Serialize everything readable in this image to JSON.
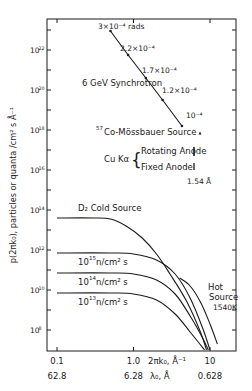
{
  "chart_data": {
    "type": "line",
    "title": "",
    "xscale": "log",
    "yscale": "log",
    "xlabel": "2πk₀, Å⁻¹",
    "xlabel_secondary": "λ₀, Å",
    "ylabel": "p(2πk₀), particles or quanta / cm² s Å⁻¹",
    "xlim": [
      0.08,
      20
    ],
    "ylim_log10": [
      7,
      23.5
    ],
    "x_ticks": [
      {
        "value": 0.1,
        "label": "0.1",
        "secondary": "62.8"
      },
      {
        "value": 1.0,
        "label": "1.0",
        "secondary": "6.28"
      },
      {
        "value": 10,
        "label": "10",
        "secondary": "0.628"
      }
    ],
    "y_ticks_log10": [
      {
        "value": 22,
        "label": "10^22"
      },
      {
        "value": 20,
        "label": "10^20"
      },
      {
        "value": 18,
        "label": "10^18"
      },
      {
        "value": 16,
        "label": "10^16"
      },
      {
        "value": 14,
        "label": "10^14"
      },
      {
        "value": 12,
        "label": "10^12"
      },
      {
        "value": 10,
        "label": "10^10"
      },
      {
        "value": 8,
        "label": "10^8"
      }
    ],
    "series": [
      {
        "name": "6 GeV Synchrotron",
        "style": "line-with-markers",
        "points": [
          {
            "x": 0.5,
            "log10y": 22.95,
            "annotation": "3×10⁻⁴ rads"
          },
          {
            "x": 0.85,
            "log10y": 21.75,
            "annotation": "2.2×10⁻⁴"
          },
          {
            "x": 1.45,
            "log10y": 20.6,
            "annotation": "1.7×10⁻⁴"
          },
          {
            "x": 2.4,
            "log10y": 19.5,
            "annotation": "1.2×10⁻⁴"
          },
          {
            "x": 4.3,
            "log10y": 18.2,
            "annotation": "10⁻⁴"
          }
        ]
      },
      {
        "name": "57Co-Mössbauer Source",
        "style": "point",
        "points": [
          {
            "x": 5.8,
            "log10y": 17.85
          }
        ]
      },
      {
        "name": "Cu Kα Rotating Anode",
        "style": "vertical-bar",
        "points": [
          {
            "x": 4.08,
            "log10y_range": [
              16.75,
              17.2
            ]
          }
        ]
      },
      {
        "name": "Cu Kα Fixed Anode",
        "style": "vertical-bar",
        "points": [
          {
            "x": 4.08,
            "log10y_range": [
              16.05,
              16.4
            ]
          }
        ],
        "annotation": "1.54 Å"
      },
      {
        "name": "D2 Cold Source",
        "style": "curve",
        "points": [
          {
            "x": 0.1,
            "log10y": 13.6
          },
          {
            "x": 0.3,
            "log10y": 13.6
          },
          {
            "x": 0.5,
            "log10y": 13.55
          },
          {
            "x": 0.8,
            "log10y": 13.2
          },
          {
            "x": 1.3,
            "log10y": 12.6
          },
          {
            "x": 2.0,
            "log10y": 11.8
          },
          {
            "x": 3.0,
            "log10y": 10.8
          },
          {
            "x": 5.0,
            "log10y": 9.4
          },
          {
            "x": 7.5,
            "log10y": 7.9
          },
          {
            "x": 9.0,
            "log10y": 7.0
          }
        ]
      },
      {
        "name": "10^15 n/cm² s",
        "style": "curve",
        "points": [
          {
            "x": 0.1,
            "log10y": 11.85
          },
          {
            "x": 0.5,
            "log10y": 11.85
          },
          {
            "x": 1.0,
            "log10y": 11.8
          },
          {
            "x": 2.0,
            "log10y": 11.5
          },
          {
            "x": 3.5,
            "log10y": 10.8
          },
          {
            "x": 5.5,
            "log10y": 9.6
          },
          {
            "x": 8.0,
            "log10y": 8.1
          },
          {
            "x": 10.0,
            "log10y": 7.0
          }
        ]
      },
      {
        "name": "10^14 n/cm² s",
        "style": "curve",
        "points": [
          {
            "x": 0.1,
            "log10y": 10.85
          },
          {
            "x": 0.5,
            "log10y": 10.85
          },
          {
            "x": 1.0,
            "log10y": 10.8
          },
          {
            "x": 2.0,
            "log10y": 10.5
          },
          {
            "x": 3.5,
            "log10y": 9.8
          },
          {
            "x": 5.5,
            "log10y": 8.7
          },
          {
            "x": 8.0,
            "log10y": 7.6
          },
          {
            "x": 9.5,
            "log10y": 7.0
          }
        ]
      },
      {
        "name": "10^13 n/cm² s",
        "style": "curve",
        "points": [
          {
            "x": 0.1,
            "log10y": 9.85
          },
          {
            "x": 0.5,
            "log10y": 9.85
          },
          {
            "x": 1.0,
            "log10y": 9.8
          },
          {
            "x": 2.0,
            "log10y": 9.5
          },
          {
            "x": 3.5,
            "log10y": 8.8
          },
          {
            "x": 5.5,
            "log10y": 7.9
          },
          {
            "x": 8.5,
            "log10y": 7.0
          }
        ]
      },
      {
        "name": "Hot Source 1540K",
        "style": "curve",
        "points": [
          {
            "x": 4.0,
            "log10y": 10.6
          },
          {
            "x": 5.5,
            "log10y": 10.2
          },
          {
            "x": 7.5,
            "log10y": 9.4
          },
          {
            "x": 10.0,
            "log10y": 8.3
          },
          {
            "x": 12.5,
            "log10y": 7.3
          }
        ]
      }
    ],
    "annotations": [
      {
        "text": "6 GeV Synchrotron"
      },
      {
        "text": "57Co-Mössbauer Source"
      },
      {
        "text": "Cu Kα { Rotating Anode / Fixed Anode"
      },
      {
        "text": "1.54 Å"
      },
      {
        "text": "D2 Cold Source"
      },
      {
        "text": "Hot Source 1540K"
      }
    ],
    "grid": false,
    "legend": "none (inline labels)"
  },
  "labels": {
    "ylabel_text": "p(2πk₀), particles or quanta /cm² s Å⁻¹",
    "xlabel_text": "2πk₀, Å⁻¹",
    "xlabel2_text": "λ₀, Å",
    "synchrotron": "6 GeV Synchrotron",
    "mossbauer": "Co-Mössbauer Source",
    "mossbauer_sup": "57",
    "cu_ka": "Cu Kα",
    "rotating": "Rotating Anode",
    "fixed": "Fixed Anode",
    "cu_wavelength": "1.54 Å",
    "d2": "D₂ Cold Source",
    "hot1": "Hot",
    "hot2": "Source",
    "hot3": "1540K",
    "flux15": "n/cm² s",
    "flux_exp15": "15",
    "flux_exp14": "14",
    "flux_exp13": "13",
    "ten": "10",
    "sync_pt1": "3×10⁻⁴ rads",
    "sync_pt2": "2.2×10⁻⁴",
    "sync_pt3": "1.7×10⁻⁴",
    "sync_pt4": "1.2×10⁻⁴",
    "sync_pt5": "10⁻⁴"
  },
  "colors": {
    "ink": "#1a1a1a",
    "background": "#ffffff"
  }
}
